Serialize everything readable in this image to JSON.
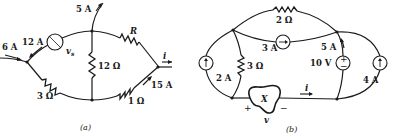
{
  "figure_a": {
    "caption": "(a)",
    "labels": {
      "current_in_left": "6 A",
      "current_branch_vs": "12 A",
      "source_vs": "v",
      "source_vs_sub": "s",
      "current_top": "5 A",
      "resistor_top_right": "R",
      "resistor_middle": "12 Ω",
      "resistor_bottom_left": "3 Ω",
      "resistor_bottom_right": "1 Ω",
      "current_bottom_right": "15 A",
      "current_out": "i"
    }
  },
  "figure_b": {
    "caption": "(b)",
    "labels": {
      "resistor_top": "2 Ω",
      "current_source_middle": "3 A",
      "current_source_left": "2 A",
      "resistor_left": "3 Ω",
      "current_branch": "5 A",
      "voltage_source": "10 V",
      "current_source_right": "4 A",
      "element_x": "X",
      "current_i": "i",
      "voltage_v": "v",
      "plus": "+",
      "minus": "−",
      "vs_plus": "+",
      "vs_minus": "−"
    }
  }
}
